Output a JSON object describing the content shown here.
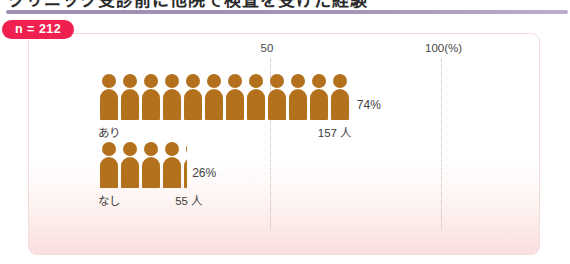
{
  "heading": {
    "text_fragment": "クリニック受診前に他院で検査を受けた経験",
    "rule_color": "#a493b6"
  },
  "badge": {
    "label": "n = 212",
    "color": "#ef2050"
  },
  "panel": {
    "background_top": "#ffffff",
    "background_bottom": "#fadfdd",
    "border_color": "#f7dcdc"
  },
  "chart_data": {
    "type": "bar",
    "title": "クリニック受診前に他院で検査を受けた経験",
    "subtitle": "n = 212",
    "categories": [
      "あり",
      "なし"
    ],
    "values": [
      74,
      26
    ],
    "counts": [
      "157 人",
      "55 人"
    ],
    "value_labels": [
      "74%",
      "26%"
    ],
    "unit_label": "人",
    "xlabel": "",
    "ylabel": "",
    "xlim": [
      0,
      100
    ],
    "ticks": [
      {
        "value": 50,
        "label": "50"
      },
      {
        "value": 100,
        "label": "100(%)"
      }
    ],
    "grid": true,
    "legend": false,
    "marker": "person-pictogram",
    "marker_color": "#b4711d",
    "marker_unit_percent": 5,
    "series": [
      {
        "name": "割合",
        "values": [
          74,
          26
        ]
      }
    ],
    "total_n": 212
  },
  "axis": {
    "tick_50": "50",
    "tick_100": "100(%)"
  },
  "rows": [
    {
      "category": "あり",
      "percent_label": "74%",
      "count_label": "157 人",
      "percent": 74
    },
    {
      "category": "なし",
      "percent_label": "26%",
      "count_label": "55 人",
      "percent": 26
    }
  ]
}
